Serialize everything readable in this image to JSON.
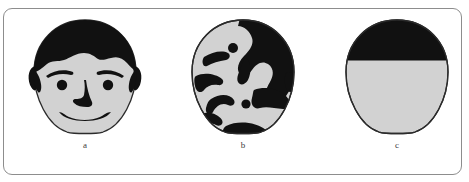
{
  "figure": {
    "caption_labels": [
      "a",
      "b",
      "c"
    ],
    "colors": {
      "ink": "#111111",
      "face_fill": "#d2d2d2",
      "outline": "#2b2b2b",
      "frame": "#8d8d8d",
      "background": "#ffffff",
      "label_text": "#3b3b3b"
    },
    "panels": [
      {
        "id": "a",
        "label": "a",
        "name": "intact-face",
        "description": "Schematic upright face: oval head with black hair covering the top, two eyebrows, two round eyes, a nose, a smiling mouth, and black ears at both sides.",
        "features": [
          "hair",
          "left-eyebrow",
          "right-eyebrow",
          "left-eye",
          "right-eye",
          "nose",
          "mouth",
          "left-ear",
          "right-ear"
        ]
      },
      {
        "id": "b",
        "label": "b",
        "name": "scrambled-face",
        "description": "Same oval head outline filled with irregular scrambled black blobs and dots so that no face can be perceived.",
        "features": [
          "blob-cluster-upper-right",
          "blob-dot-upper",
          "blob-streak-left",
          "blob-streak-mid",
          "blob-wedge-left",
          "blob-curve-lower",
          "blob-dot-lower",
          "blob-bottom-edge"
        ]
      },
      {
        "id": "c",
        "label": "c",
        "name": "control-oval",
        "description": "Oval head outline with only the upper third filled solid black and a straight horizontal boundary; featureless below.",
        "features": [
          "black-top-region",
          "horizontal-divider",
          "blank-lower-region"
        ]
      }
    ]
  }
}
